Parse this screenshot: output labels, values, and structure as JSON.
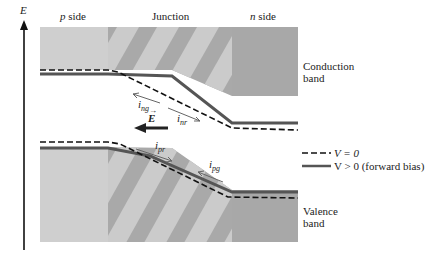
{
  "axis": {
    "label": "E"
  },
  "regions": {
    "p_side": {
      "label_var": "p",
      "label_text": " side"
    },
    "junction": {
      "label": "Junction"
    },
    "n_side": {
      "label_var": "n",
      "label_text": " side"
    }
  },
  "bands": {
    "conduction": {
      "line1": "Conduction",
      "line2": "band"
    },
    "valence": {
      "line1": "Valence",
      "line2": "band"
    }
  },
  "currents": {
    "i_ng": {
      "main": "i",
      "sub": "ng"
    },
    "i_nr": {
      "main": "i",
      "sub": "nr"
    },
    "i_pr": {
      "main": "i",
      "sub": "pr"
    },
    "i_pg": {
      "main": "i",
      "sub": "pg"
    }
  },
  "field": {
    "label": "E"
  },
  "legend": {
    "items": [
      {
        "style": "dashed",
        "label": "V = 0"
      },
      {
        "style": "solid",
        "label": "V > 0 (forward bias)"
      }
    ]
  },
  "colors": {
    "p_region": "#cfcfcf",
    "junction_dark": "#a9a9a9",
    "junction_light": "#cbcbcb",
    "n_region": "#a8a8a8",
    "solid_line": "#555555",
    "dashed_line": "#111111"
  }
}
